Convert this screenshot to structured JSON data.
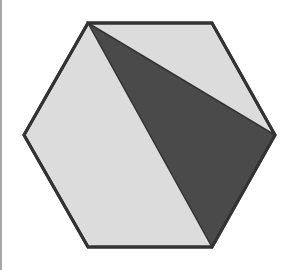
{
  "figure": {
    "width": 295,
    "height": 270,
    "colors": {
      "background": "#ffffff",
      "hexagon_fill": "#dcdcdc",
      "triangle_fill": "#4a4a4a",
      "outline": "#333333",
      "left_edge": "#a8a8a8"
    },
    "hexagon": {
      "points": "88,23 212,23 275,135 212,247 88,247 24,135"
    },
    "shaded_triangle": {
      "points": "88,23 275,135 212,247"
    },
    "stroke_width": 3
  }
}
